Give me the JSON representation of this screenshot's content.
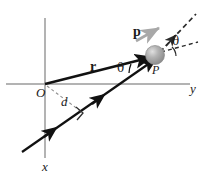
{
  "figure": {
    "name": "angular-momentum-particle-diagram",
    "background_color": "#ffffff"
  },
  "axes": {
    "x_label": "x",
    "y_label": "y",
    "color": "#9a9a9a",
    "origin_label": "O"
  },
  "labels": {
    "position_vector": "r",
    "momentum_vector": "p",
    "momentum_at_particle": "p",
    "particle": "P",
    "moment_arm": "d",
    "angle_at_particle": "θ",
    "angle_at_asymptote": "θ"
  },
  "colors": {
    "vector_black": "#111111",
    "momentum_gray": "#a8a8a8",
    "particle_fill": "#9d9d9d",
    "particle_highlight": "#d4d4d4",
    "axis_gray": "#9a9a9a",
    "dashed_gray": "#8f8f8f",
    "dashed_dark": "#2b2b2b"
  },
  "geometry": {
    "origin": [
      45,
      84
    ],
    "particle_center": [
      155,
      55
    ],
    "x_axis_top": [
      45,
      18
    ],
    "x_axis_bottom": [
      45,
      158
    ],
    "y_axis_right": [
      190,
      84
    ],
    "trajectory_start": [
      22,
      152
    ],
    "trajectory_end": [
      158,
      58
    ],
    "perpendicular_foot": [
      84,
      114
    ]
  }
}
